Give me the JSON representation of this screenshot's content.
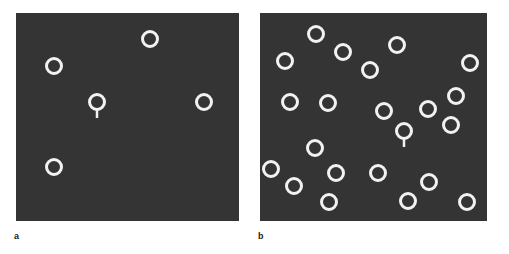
{
  "figure": {
    "width": 509,
    "height": 254,
    "page_background": "#ffffff",
    "caption_labels": [
      "a",
      "b"
    ]
  },
  "style": {
    "field_color": "#343434",
    "stimulus_color": "#f2f2f2",
    "stimulus_diameter": 18,
    "stimulus_stroke": 3,
    "target_tail_length": 7,
    "label_color": "#1a1a1a"
  },
  "panels": [
    {
      "id": "panel-a",
      "label": "a",
      "label_x": 14,
      "label_y": 231,
      "x": 16,
      "y": 13,
      "width": 223,
      "height": 208,
      "field_color": "#343434",
      "distractor_count": 4,
      "target_count": 1,
      "total_items": 5,
      "target_letter": "Q",
      "distractor_letter": "O",
      "items": [
        {
          "type": "distractor",
          "letter": "O",
          "cx": 134,
          "cy": 26,
          "r": 9
        },
        {
          "type": "distractor",
          "letter": "O",
          "cx": 38,
          "cy": 53,
          "r": 9
        },
        {
          "type": "target",
          "letter": "Q",
          "cx": 81,
          "cy": 89,
          "r": 9
        },
        {
          "type": "distractor",
          "letter": "O",
          "cx": 188,
          "cy": 89,
          "r": 9
        },
        {
          "type": "distractor",
          "letter": "O",
          "cx": 38,
          "cy": 154,
          "r": 9
        }
      ]
    },
    {
      "id": "panel-b",
      "label": "b",
      "label_x": 258,
      "label_y": 231,
      "x": 260,
      "y": 13,
      "width": 227,
      "height": 208,
      "field_color": "#343434",
      "distractor_count": 21,
      "target_count": 1,
      "total_items": 22,
      "target_letter": "Q",
      "distractor_letter": "O",
      "items": [
        {
          "type": "distractor",
          "letter": "O",
          "cx": 56,
          "cy": 21,
          "r": 9
        },
        {
          "type": "distractor",
          "letter": "O",
          "cx": 83,
          "cy": 39,
          "r": 9
        },
        {
          "type": "distractor",
          "letter": "O",
          "cx": 137,
          "cy": 32,
          "r": 9
        },
        {
          "type": "distractor",
          "letter": "O",
          "cx": 25,
          "cy": 48,
          "r": 9
        },
        {
          "type": "distractor",
          "letter": "O",
          "cx": 110,
          "cy": 57,
          "r": 9
        },
        {
          "type": "distractor",
          "letter": "O",
          "cx": 210,
          "cy": 50,
          "r": 9
        },
        {
          "type": "distractor",
          "letter": "O",
          "cx": 30,
          "cy": 89,
          "r": 9
        },
        {
          "type": "distractor",
          "letter": "O",
          "cx": 68,
          "cy": 90,
          "r": 9
        },
        {
          "type": "distractor",
          "letter": "O",
          "cx": 196,
          "cy": 83,
          "r": 9
        },
        {
          "type": "distractor",
          "letter": "O",
          "cx": 124,
          "cy": 98,
          "r": 9
        },
        {
          "type": "distractor",
          "letter": "O",
          "cx": 168,
          "cy": 96,
          "r": 9
        },
        {
          "type": "distractor",
          "letter": "O",
          "cx": 191,
          "cy": 112,
          "r": 9
        },
        {
          "type": "target",
          "letter": "Q",
          "cx": 144,
          "cy": 118,
          "r": 9
        },
        {
          "type": "distractor",
          "letter": "O",
          "cx": 55,
          "cy": 135,
          "r": 9
        },
        {
          "type": "distractor",
          "letter": "O",
          "cx": 11,
          "cy": 156,
          "r": 9
        },
        {
          "type": "distractor",
          "letter": "O",
          "cx": 76,
          "cy": 160,
          "r": 9
        },
        {
          "type": "distractor",
          "letter": "O",
          "cx": 118,
          "cy": 160,
          "r": 9
        },
        {
          "type": "distractor",
          "letter": "O",
          "cx": 34,
          "cy": 173,
          "r": 9
        },
        {
          "type": "distractor",
          "letter": "O",
          "cx": 169,
          "cy": 169,
          "r": 9
        },
        {
          "type": "distractor",
          "letter": "O",
          "cx": 69,
          "cy": 189,
          "r": 9
        },
        {
          "type": "distractor",
          "letter": "O",
          "cx": 148,
          "cy": 188,
          "r": 9
        },
        {
          "type": "distractor",
          "letter": "O",
          "cx": 207,
          "cy": 189,
          "r": 9
        }
      ]
    }
  ]
}
